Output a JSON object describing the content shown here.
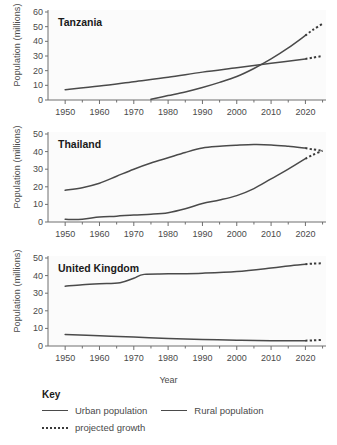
{
  "axis_title_x": "Year",
  "axis_title_y": "Population (millions)",
  "legend": {
    "title": "Key",
    "items": [
      {
        "name": "urban",
        "label": "Urban population",
        "style": "solid",
        "color": "#4a4a4a"
      },
      {
        "name": "rural",
        "label": "Rural population",
        "style": "solid",
        "color": "#4a4a4a"
      },
      {
        "name": "projected",
        "label": "projected growth",
        "style": "dotted",
        "color": "#3a3a3a"
      }
    ]
  },
  "chart_data": [
    {
      "type": "line",
      "title": "Tanzania",
      "xlabel": "Year",
      "ylabel": "Population (millions)",
      "xlim": [
        1945,
        2026
      ],
      "ylim": [
        0,
        60
      ],
      "yticks": [
        0,
        10,
        20,
        30,
        40,
        50,
        60
      ],
      "xticks": [
        1950,
        1960,
        1970,
        1980,
        1990,
        2000,
        2010,
        2020
      ],
      "xminor_step": 5,
      "grid": false,
      "legend_position": "below-figure",
      "series": [
        {
          "name": "Urban population",
          "style": "solid",
          "x": [
            1975,
            1980,
            1985,
            1990,
            1995,
            2000,
            2005,
            2010,
            2015,
            2020
          ],
          "values": [
            0.5,
            3.0,
            5.5,
            8.5,
            12.0,
            16.0,
            21.5,
            28.0,
            35.5,
            44.0
          ],
          "projected": {
            "x": [
              2020,
              2022,
              2025
            ],
            "values": [
              44.0,
              47.5,
              52.0
            ]
          }
        },
        {
          "name": "Rural population",
          "style": "solid",
          "x": [
            1950,
            1960,
            1970,
            1980,
            1990,
            2000,
            2010,
            2020
          ],
          "values": [
            7.0,
            9.5,
            12.5,
            15.5,
            19.0,
            22.0,
            25.0,
            28.0
          ],
          "projected": {
            "x": [
              2020,
              2022,
              2025
            ],
            "values": [
              28.0,
              28.8,
              30.0
            ]
          }
        }
      ]
    },
    {
      "type": "line",
      "title": "Thailand",
      "xlabel": "Year",
      "ylabel": "Population (millions)",
      "xlim": [
        1945,
        2026
      ],
      "ylim": [
        0,
        50
      ],
      "yticks": [
        0,
        10,
        20,
        30,
        40,
        50
      ],
      "xticks": [
        1950,
        1960,
        1970,
        1980,
        1990,
        2000,
        2010,
        2020
      ],
      "xminor_step": 5,
      "grid": false,
      "legend_position": "below-figure",
      "series": [
        {
          "name": "Urban population",
          "style": "solid",
          "x": [
            1950,
            1955,
            1960,
            1965,
            1970,
            1975,
            1980,
            1985,
            1990,
            1995,
            2000,
            2005,
            2010,
            2015,
            2020
          ],
          "values": [
            1.5,
            1.6,
            2.8,
            3.3,
            4.0,
            4.4,
            5.3,
            7.5,
            10.5,
            12.5,
            15.0,
            19.0,
            24.5,
            30.0,
            36.0
          ],
          "projected": {
            "x": [
              2020,
              2022,
              2025
            ],
            "values": [
              36.0,
              38.0,
              40.5
            ]
          }
        },
        {
          "name": "Rural population",
          "style": "solid",
          "x": [
            1950,
            1955,
            1960,
            1965,
            1970,
            1975,
            1980,
            1985,
            1990,
            1995,
            2000,
            2005,
            2010,
            2015,
            2020
          ],
          "values": [
            18.0,
            19.5,
            22.0,
            26.0,
            30.0,
            33.5,
            36.5,
            39.5,
            42.0,
            43.0,
            43.6,
            44.0,
            43.8,
            43.0,
            42.0
          ],
          "projected": {
            "x": [
              2020,
              2022,
              2025
            ],
            "values": [
              42.0,
              41.3,
              40.5
            ]
          }
        }
      ]
    },
    {
      "type": "line",
      "title": "United Kingdom",
      "xlabel": "Year",
      "ylabel": "Population (millions)",
      "xlim": [
        1945,
        2026
      ],
      "ylim": [
        0,
        50
      ],
      "yticks": [
        0,
        10,
        20,
        30,
        40,
        50
      ],
      "xticks": [
        1950,
        1960,
        1970,
        1980,
        1990,
        2000,
        2010,
        2020
      ],
      "xminor_step": 5,
      "grid": false,
      "legend_position": "below-figure",
      "series": [
        {
          "name": "Urban population",
          "style": "solid",
          "x": [
            1950,
            1955,
            1960,
            1966,
            1970,
            1973,
            1980,
            1990,
            2000,
            2010,
            2015,
            2020
          ],
          "values": [
            34.0,
            34.8,
            35.4,
            36.0,
            38.5,
            40.7,
            41.0,
            41.4,
            42.3,
            44.3,
            45.5,
            46.5
          ],
          "projected": {
            "x": [
              2020,
              2022,
              2025
            ],
            "values": [
              46.5,
              46.8,
              47.0
            ]
          }
        },
        {
          "name": "Rural population",
          "style": "solid",
          "x": [
            1950,
            1960,
            1970,
            1980,
            1990,
            2000,
            2010,
            2020
          ],
          "values": [
            6.5,
            5.8,
            5.1,
            4.3,
            3.7,
            3.3,
            3.0,
            3.0
          ],
          "projected": {
            "x": [
              2020,
              2022,
              2025
            ],
            "values": [
              3.0,
              3.2,
              3.5
            ]
          }
        }
      ]
    }
  ]
}
